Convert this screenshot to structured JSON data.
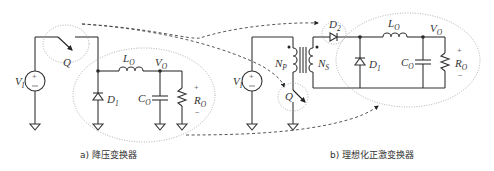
{
  "diagram": {
    "panel_a": {
      "caption": "a) 降压变换器",
      "labels": {
        "source": "V",
        "source_sub": "I",
        "switch": "Q",
        "inductor": "L",
        "inductor_sub": "O",
        "output": "V",
        "output_sub": "O",
        "diode": "D",
        "diode_sub": "1",
        "capacitor": "C",
        "capacitor_sub": "O",
        "resistor": "R",
        "resistor_sub": "O",
        "plus": "+",
        "minus": "−"
      }
    },
    "panel_b": {
      "caption": "b) 理想化正激变换器",
      "labels": {
        "source": "V",
        "source_sub": "I",
        "primary": "N",
        "primary_sub": "P",
        "secondary": "N",
        "secondary_sub": "S",
        "switch": "Q",
        "diode2": "D",
        "diode2_sub": "2",
        "inductor": "L",
        "inductor_sub": "O",
        "output": "V",
        "output_sub": "O",
        "diode": "D",
        "diode_sub": "1",
        "capacitor": "C",
        "capacitor_sub": "O",
        "resistor": "R",
        "resistor_sub": "O",
        "plus": "+",
        "minus": "−"
      }
    }
  }
}
